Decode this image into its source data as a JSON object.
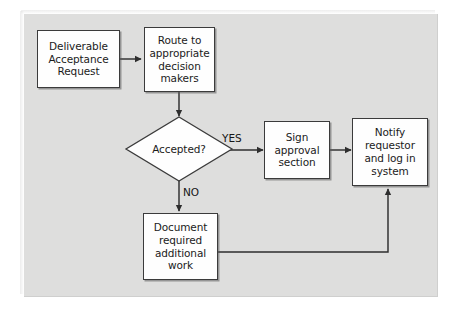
{
  "diagram": {
    "panel_color": "#dededd",
    "node_fill": "#fefefe",
    "line_color": "#3b3b3b",
    "nodes": [
      {
        "id": "deliverable-acceptance-request",
        "shape": "process",
        "label": "Deliverable\nAcceptance\nRequest"
      },
      {
        "id": "route-to-decision-makers",
        "shape": "process",
        "label": "Route to\nappropriate\ndecision\nmakers"
      },
      {
        "id": "accepted-decision",
        "shape": "decision",
        "label": "Accepted?"
      },
      {
        "id": "sign-approval-section",
        "shape": "process",
        "label": "Sign\napproval\nsection"
      },
      {
        "id": "notify-requestor-and-log",
        "shape": "process",
        "label": "Notify\nrequestor\nand log in\nsystem"
      },
      {
        "id": "document-required-work",
        "shape": "process",
        "label": "Document\nrequired\nadditional\nwork"
      }
    ],
    "edge_labels": {
      "yes": "YES",
      "no": "NO"
    },
    "edges": [
      {
        "from": "deliverable-acceptance-request",
        "to": "route-to-decision-makers",
        "label": ""
      },
      {
        "from": "route-to-decision-makers",
        "to": "accepted-decision",
        "label": ""
      },
      {
        "from": "accepted-decision",
        "to": "sign-approval-section",
        "label": "YES"
      },
      {
        "from": "accepted-decision",
        "to": "document-required-work",
        "label": "NO"
      },
      {
        "from": "sign-approval-section",
        "to": "notify-requestor-and-log",
        "label": ""
      },
      {
        "from": "document-required-work",
        "to": "notify-requestor-and-log",
        "label": ""
      }
    ]
  }
}
